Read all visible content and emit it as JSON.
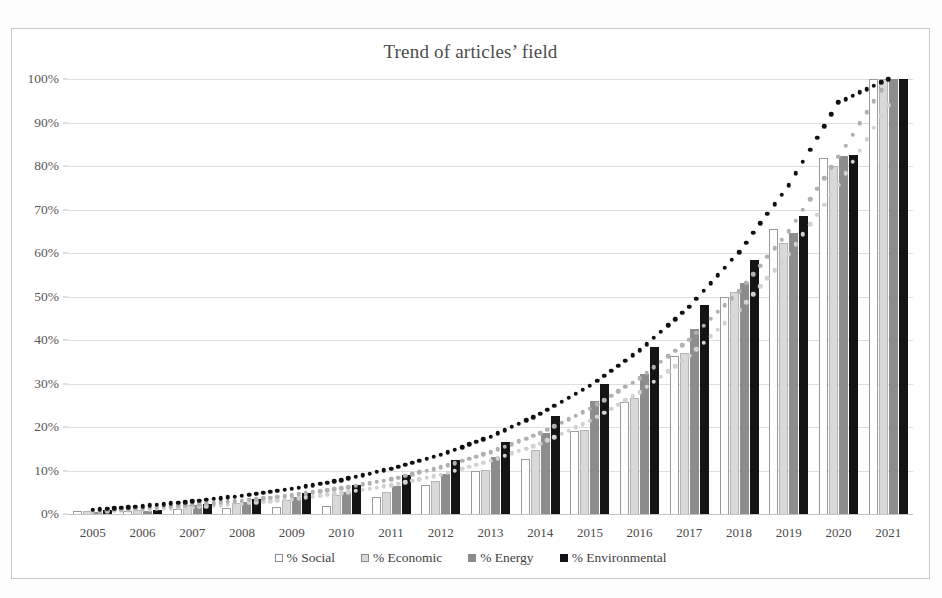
{
  "chart": {
    "title": "Trend of articles’ field",
    "legend_position": "bottom"
  },
  "legend": [
    {
      "label": "% Social",
      "color": "#ffffff",
      "key": "social"
    },
    {
      "label": "% Economic",
      "color": "#d9d9d9",
      "key": "economic"
    },
    {
      "label": "% Energy",
      "color": "#8c8c8c",
      "key": "energy"
    },
    {
      "label": "% Environmental",
      "color": "#141414",
      "key": "environmental"
    }
  ],
  "yticks": [
    "0%",
    "10%",
    "20%",
    "30%",
    "40%",
    "50%",
    "60%",
    "70%",
    "80%",
    "90%",
    "100%"
  ],
  "chart_data": {
    "type": "bar",
    "title": "Trend of articles’ field",
    "xlabel": "",
    "ylabel": "",
    "ylim": [
      0,
      100
    ],
    "ytick_values": [
      0,
      10,
      20,
      30,
      40,
      50,
      60,
      70,
      80,
      90,
      100
    ],
    "ytick_labels": [
      "0%",
      "10%",
      "20%",
      "30%",
      "40%",
      "50%",
      "60%",
      "70%",
      "80%",
      "90%",
      "100%"
    ],
    "grid": true,
    "legend": [
      "% Social",
      "% Economic",
      "% Energy",
      "% Environmental"
    ],
    "categories": [
      "2005",
      "2006",
      "2007",
      "2008",
      "2009",
      "2010",
      "2011",
      "2012",
      "2013",
      "2014",
      "2015",
      "2016",
      "2017",
      "2018",
      "2019",
      "2020",
      "2021"
    ],
    "series": [
      {
        "name": "% Social",
        "color": "#ffffff",
        "values": [
          0.8,
          0.8,
          1.2,
          1.4,
          1.6,
          1.9,
          4.0,
          6.6,
          9.9,
          12.6,
          19.0,
          25.7,
          36.4,
          50.0,
          65.6,
          81.8,
          100.0
        ]
      },
      {
        "name": "% Economic",
        "color": "#d9d9d9",
        "values": [
          0.7,
          0.9,
          2.0,
          2.6,
          3.2,
          4.3,
          5.1,
          7.5,
          10.2,
          14.8,
          19.3,
          26.6,
          37.0,
          51.0,
          62.3,
          80.1,
          100.0
        ]
      },
      {
        "name": "% Energy",
        "color": "#8c8c8c",
        "values": [
          0.4,
          0.8,
          2.1,
          2.8,
          4.0,
          5.1,
          6.4,
          9.3,
          13.0,
          18.6,
          26.0,
          32.2,
          42.5,
          53.0,
          64.5,
          82.3,
          100.0
        ]
      },
      {
        "name": "% Environmental",
        "color": "#141414",
        "values": [
          0.9,
          1.0,
          2.4,
          3.4,
          4.8,
          6.6,
          9.0,
          12.4,
          16.5,
          22.5,
          30.0,
          38.3,
          48.0,
          58.5,
          68.5,
          82.6,
          100.0
        ]
      }
    ],
    "trendlines": [
      {
        "name": "% Social trend",
        "style": "dotted",
        "color": "#d2d2d2",
        "values": [
          0.5,
          1.0,
          1.6,
          2.4,
          3.4,
          4.8,
          6.6,
          9.0,
          12.2,
          16.2,
          21.4,
          28.0,
          36.4,
          46.8,
          59.7,
          75.7,
          94.0
        ]
      },
      {
        "name": "% Economic trend",
        "style": "dotted",
        "color": "#b0b0b0",
        "values": [
          0.7,
          1.3,
          2.1,
          3.1,
          4.3,
          5.9,
          8.0,
          10.7,
          14.2,
          18.6,
          24.2,
          31.2,
          40.1,
          51.2,
          65.0,
          82.1,
          100.0
        ]
      },
      {
        "name": "% Environmental trend",
        "style": "dotted",
        "color": "#111111",
        "values": [
          1.0,
          1.8,
          2.9,
          4.2,
          5.8,
          7.8,
          10.4,
          13.6,
          17.8,
          23.0,
          29.5,
          37.6,
          47.7,
          60.2,
          75.6,
          94.6,
          100.0
        ]
      }
    ]
  }
}
